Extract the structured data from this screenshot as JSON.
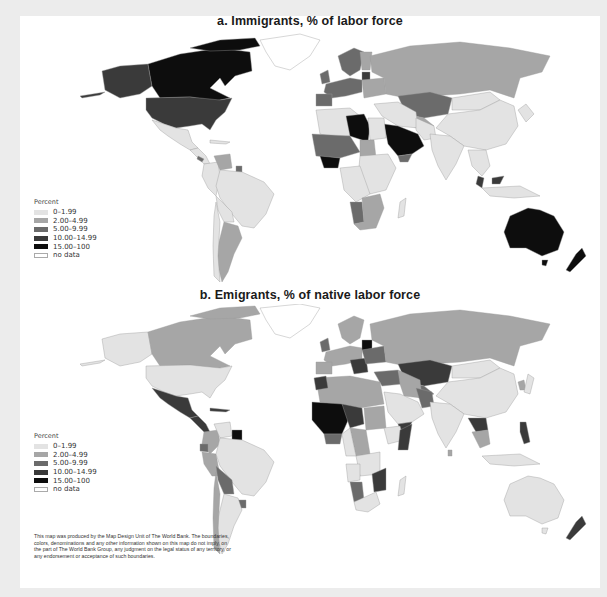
{
  "maps": [
    {
      "title": "a. Immigrants, % of labor force",
      "legend": {
        "title": "Percent",
        "items": [
          {
            "label": "0–1.99",
            "color": "#e3e3e3"
          },
          {
            "label": "2.00–4.99",
            "color": "#a6a6a6"
          },
          {
            "label": "5.00–9.99",
            "color": "#6b6b6b"
          },
          {
            "label": "10.00–14.99",
            "color": "#3a3a3a"
          },
          {
            "label": "15.00–100",
            "color": "#0d0d0d"
          },
          {
            "label": "no data",
            "color": "#ffffff"
          }
        ]
      }
    },
    {
      "title": "b. Emigrants, % of native labor force",
      "legend": {
        "title": "Percent",
        "items": [
          {
            "label": "0–1.99",
            "color": "#e3e3e3"
          },
          {
            "label": "2.00–4.99",
            "color": "#a6a6a6"
          },
          {
            "label": "5.00–9.99",
            "color": "#6b6b6b"
          },
          {
            "label": "10.00–14.99",
            "color": "#3a3a3a"
          },
          {
            "label": "15.00–100",
            "color": "#0d0d0d"
          },
          {
            "label": "no data",
            "color": "#ffffff"
          }
        ]
      }
    }
  ],
  "disclaimer": "This map was produced by the Map Design Unit of The World Bank. The boundaries, colors, denominations and any other information shown on this map do not imply, on the part of The World Bank Group, any judgment on the legal status of any territory, or any endorsement or acceptance of such boundaries.",
  "colors": {
    "c0": "#e3e3e3",
    "c1": "#a6a6a6",
    "c2": "#6b6b6b",
    "c3": "#3a3a3a",
    "c4": "#0d0d0d",
    "frame": "#ececec"
  }
}
